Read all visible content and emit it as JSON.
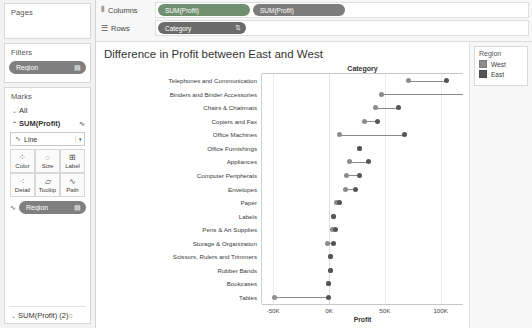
{
  "sidebar": {
    "pages": {
      "title": "Pages",
      "pills": []
    },
    "filters": {
      "title": "Filters",
      "pills": [
        {
          "label": "Region",
          "icon": "▤"
        }
      ]
    },
    "marks": {
      "title": "Marks",
      "all_label": "All",
      "all_caret": "⌄",
      "measure_label": "SUM(Profit)",
      "measure_caret": "⌃",
      "measure_icon": "∿",
      "mark_type": {
        "label": "Line",
        "icon": "∿",
        "arrow": "▾"
      },
      "buttons": [
        {
          "label": "Color",
          "icon": "⁘"
        },
        {
          "label": "Size",
          "icon": "◌"
        },
        {
          "label": "Label",
          "icon": "⊞"
        },
        {
          "label": "Detail",
          "icon": "⁖"
        },
        {
          "label": "Tooltip",
          "icon": "▱"
        },
        {
          "label": "Path",
          "icon": "∿"
        }
      ],
      "encoding_pill": {
        "lead": "∿",
        "label": "Region",
        "icon": "▤"
      },
      "second_measure": {
        "label": "SUM(Profit) (2)",
        "caret": "⌄",
        "icon": "○"
      }
    }
  },
  "shelves": {
    "columns": {
      "label": "Columns",
      "icon": "⦀",
      "pills": [
        {
          "label": "SUM(Profit)",
          "icon": ""
        },
        {
          "label": "SUM(Profit)",
          "icon": ""
        }
      ]
    },
    "rows": {
      "label": "Rows",
      "icon": "☰",
      "pills": [
        {
          "label": "Category",
          "icon": "⇅"
        }
      ]
    }
  },
  "viz": {
    "title": "Difference in Profit between East and West",
    "row_header": "Category"
  },
  "legend": {
    "title": "Region",
    "items": [
      {
        "label": "West",
        "color": "#8c8c8c"
      },
      {
        "label": "East",
        "color": "#555555"
      }
    ]
  },
  "chart_data": {
    "type": "scatter",
    "subtype": "dumbbell",
    "title": "Difference in Profit between East and West",
    "xlabel": "Profit",
    "ylabel": "Category",
    "xlim": [
      -60000,
      120000
    ],
    "xticks": [
      -50000,
      0,
      50000,
      100000
    ],
    "xticklabels": [
      "-50K",
      "0K",
      "50K",
      "100K"
    ],
    "grid": true,
    "legend_position": "right",
    "series": [
      {
        "name": "West",
        "color": "#8c8c8c"
      },
      {
        "name": "East",
        "color": "#555555"
      }
    ],
    "categories": [
      "Telephones and Communication",
      "Binders and Binder Accessories",
      "Chairs & Chairmats",
      "Copiers and Fax",
      "Office Machines",
      "Office Furnishings",
      "Appliances",
      "Computer Peripherals",
      "Envelopes",
      "Paper",
      "Labels",
      "Pens & Art Supplies",
      "Storage & Organization",
      "Scissors, Rulers and Trimmers",
      "Rubber Bands",
      "Bookcases",
      "Tables"
    ],
    "points": [
      {
        "category": "Telephones and Communication",
        "west": 71000,
        "east": 105000
      },
      {
        "category": "Binders and Binder Accessories",
        "west": 47000,
        "east": 126000
      },
      {
        "category": "Chairs & Chairmats",
        "west": 42000,
        "east": 62000
      },
      {
        "category": "Copiers and Fax",
        "west": 32000,
        "east": 43000
      },
      {
        "category": "Office Machines",
        "west": 9000,
        "east": 68000
      },
      {
        "category": "Office Furnishings",
        "west": 27000,
        "east": 27000
      },
      {
        "category": "Appliances",
        "west": 18000,
        "east": 35000
      },
      {
        "category": "Computer Peripherals",
        "west": 16000,
        "east": 27000
      },
      {
        "category": "Envelopes",
        "west": 15000,
        "east": 24000
      },
      {
        "category": "Paper",
        "west": 7000,
        "east": 9000
      },
      {
        "category": "Labels",
        "west": 4000,
        "east": 4000
      },
      {
        "category": "Pens & Art Supplies",
        "west": 3000,
        "east": 6000
      },
      {
        "category": "Storage & Organization",
        "west": -1000,
        "east": 4000
      },
      {
        "category": "Scissors, Rulers and Trimmers",
        "west": 1000,
        "east": 1000
      },
      {
        "category": "Rubber Bands",
        "west": 1000,
        "east": 1000
      },
      {
        "category": "Bookcases",
        "west": 0,
        "east": 0
      },
      {
        "category": "Tables",
        "west": -49000,
        "east": 0
      }
    ]
  }
}
